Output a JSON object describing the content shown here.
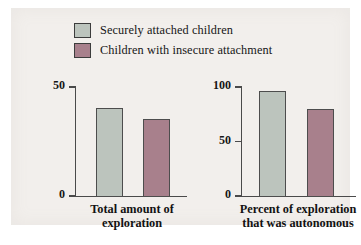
{
  "figure": {
    "background_color": "#f2efec",
    "page_color": "#ffffff"
  },
  "legend": {
    "position": "top-center",
    "items": [
      {
        "label": "Securely attached children",
        "color": "#bcc4bd",
        "swatch_name": "legend-swatch-secure"
      },
      {
        "label": "Children with insecure attachment",
        "color": "#a8808c",
        "swatch_name": "legend-swatch-insecure"
      }
    ]
  },
  "chart_data": [
    {
      "type": "bar",
      "title": "",
      "xlabel": "Total amount of exploration",
      "xlabel_lines": [
        "Total amount of",
        "exploration"
      ],
      "ylabel": "",
      "ylim": [
        0,
        50
      ],
      "yticks": [
        0,
        50
      ],
      "ytick_labels": [
        "0",
        "50"
      ],
      "grid": false,
      "categories": [
        "Securely attached children",
        "Children with insecure attachment"
      ],
      "series": [
        {
          "name": "Securely attached children",
          "values": [
            41
          ],
          "color": "#bcc4bd"
        },
        {
          "name": "Children with insecure attachment",
          "values": [
            36
          ],
          "color": "#a8808c"
        }
      ],
      "values": [
        41,
        36
      ]
    },
    {
      "type": "bar",
      "title": "",
      "xlabel": "Percent of exploration that was autonomous",
      "xlabel_lines": [
        "Percent of exploration",
        "that was autonomous"
      ],
      "ylabel": "",
      "ylim": [
        0,
        100
      ],
      "yticks": [
        0,
        50,
        100
      ],
      "ytick_labels": [
        "0",
        "50",
        "100"
      ],
      "grid": false,
      "categories": [
        "Securely attached children",
        "Children with insecure attachment"
      ],
      "series": [
        {
          "name": "Securely attached children",
          "values": [
            97
          ],
          "color": "#bcc4bd"
        },
        {
          "name": "Children with insecure attachment",
          "values": [
            81
          ],
          "color": "#a8808c"
        }
      ],
      "values": [
        97,
        81
      ]
    }
  ]
}
